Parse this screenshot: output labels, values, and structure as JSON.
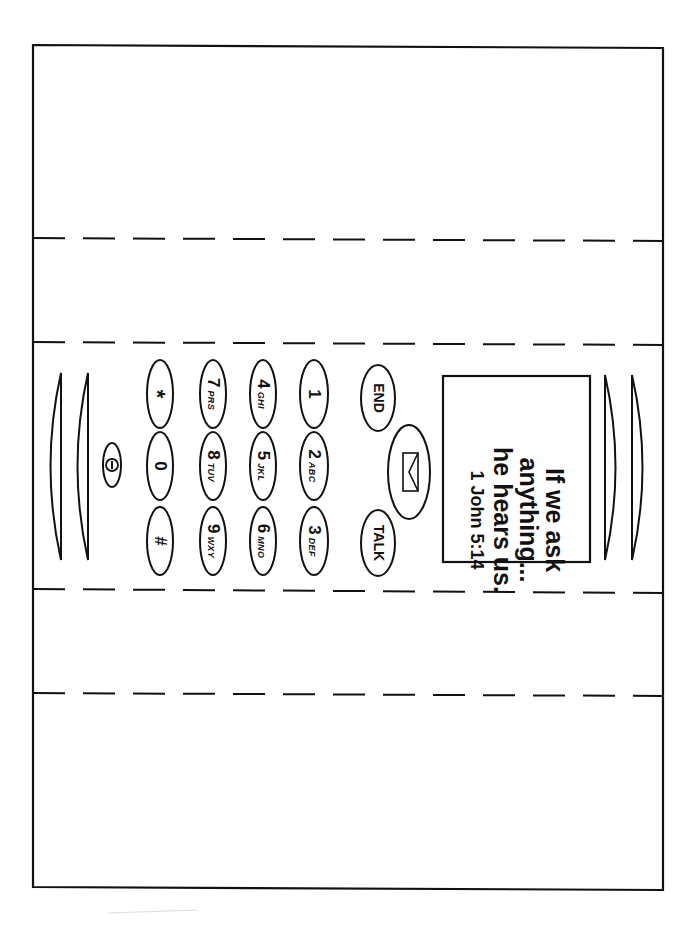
{
  "document": {
    "title": "Cell phone craft template",
    "orientation": "rotated-90",
    "fold_lines": 4
  },
  "screen": {
    "lines": [
      "If we ask",
      "anything...",
      "he hears us."
    ],
    "reference": "1 John 5:14"
  },
  "controls": {
    "end_label": "END",
    "talk_label": "TALK",
    "message_icon": "envelope-icon",
    "power_icon": "power-icon"
  },
  "keypad": {
    "keys": [
      {
        "num": "1",
        "letters": ""
      },
      {
        "num": "2",
        "letters": "ABC"
      },
      {
        "num": "3",
        "letters": "DEF"
      },
      {
        "num": "4",
        "letters": "GHI"
      },
      {
        "num": "5",
        "letters": "JKL"
      },
      {
        "num": "6",
        "letters": "MNO"
      },
      {
        "num": "7",
        "letters": "PRS"
      },
      {
        "num": "8",
        "letters": "TUV"
      },
      {
        "num": "9",
        "letters": "WXY"
      },
      {
        "num": "*",
        "letters": ""
      },
      {
        "num": "0",
        "letters": ""
      },
      {
        "num": "#",
        "letters": ""
      }
    ]
  },
  "colors": {
    "ink": "#111111",
    "paper": "#ffffff"
  }
}
